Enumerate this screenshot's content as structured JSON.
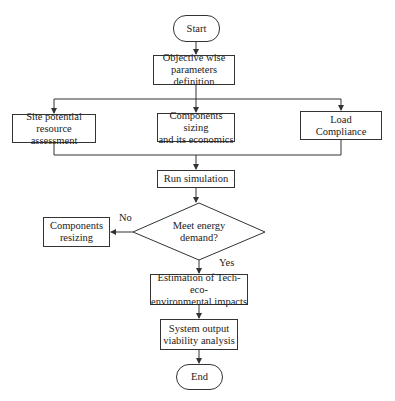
{
  "flowchart": {
    "nodes": {
      "start": {
        "label": "Start",
        "shape": "terminal"
      },
      "objective": {
        "label": "Objective wise parameters definition",
        "line1": "Objective wise",
        "line2": "parameters definition",
        "shape": "process"
      },
      "site": {
        "label": "Site potential resource assessment",
        "line1": "Site potential",
        "line2": "resource assessment",
        "shape": "process"
      },
      "components_sizing": {
        "label": "Components sizing and its economics",
        "line1": "Components sizing",
        "line2": "and its economics",
        "shape": "process"
      },
      "load": {
        "label": "Load Compliance",
        "line1": "Load",
        "line2": "Compliance",
        "shape": "process"
      },
      "run_sim": {
        "label": "Run simulation",
        "shape": "process"
      },
      "decision": {
        "label": "Meet energy demand?",
        "line1": "Meet energy",
        "line2": "demand?",
        "shape": "decision"
      },
      "resizing": {
        "label": "Components resizing",
        "line1": "Components",
        "line2": "resizing",
        "shape": "process"
      },
      "estimation": {
        "label": "Estimation of Tech-eco-environmental impacts",
        "line1": "Estimation of Tech-eco-",
        "line2": "environmental impacts",
        "shape": "process"
      },
      "viability": {
        "label": "System output viability analysis",
        "line1": "System output",
        "line2": "viability analysis",
        "shape": "process"
      },
      "end": {
        "label": "End",
        "shape": "terminal"
      }
    },
    "edge_labels": {
      "no": "No",
      "yes": "Yes"
    },
    "edges": [
      [
        "start",
        "objective"
      ],
      [
        "objective",
        "site"
      ],
      [
        "objective",
        "components_sizing"
      ],
      [
        "objective",
        "load"
      ],
      [
        "site",
        "run_sim"
      ],
      [
        "components_sizing",
        "run_sim"
      ],
      [
        "load",
        "run_sim"
      ],
      [
        "run_sim",
        "decision"
      ],
      [
        "decision",
        "resizing",
        "No"
      ],
      [
        "decision",
        "estimation",
        "Yes"
      ],
      [
        "estimation",
        "viability"
      ],
      [
        "viability",
        "end"
      ]
    ],
    "colors": {
      "stroke": "#333333",
      "fill": "#ffffff",
      "text": "#222222"
    }
  }
}
